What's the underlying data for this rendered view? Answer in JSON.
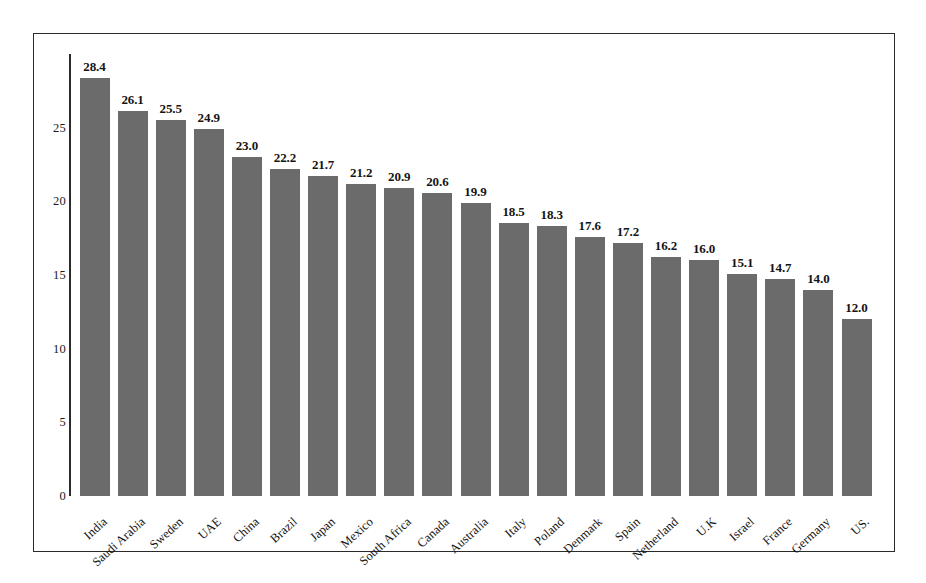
{
  "chart_data": {
    "type": "bar",
    "title": "",
    "subtitle": "",
    "xlabel": "",
    "ylabel": "",
    "ylim": [
      0,
      30
    ],
    "yticks": [
      0,
      5,
      10,
      15,
      20,
      25
    ],
    "ytick_labels": [
      "0",
      "5",
      "10",
      "15",
      "20",
      "25"
    ],
    "grid": false,
    "legend": false,
    "bar_color": "#6b6b6b",
    "frame_color": "#2b2b2b",
    "value_label_format": "one-decimal",
    "categories": [
      "India",
      "Saudi Arabia",
      "Sweden",
      "UAE",
      "China",
      "Brazil",
      "Japan",
      "Mexico",
      "South Africa",
      "Canada",
      "Australia",
      "Italy",
      "Poland",
      "Denmark",
      "Spain",
      "Netherland",
      "U.K",
      "Israel",
      "France",
      "Germany",
      "US."
    ],
    "values": [
      28.4,
      26.1,
      25.5,
      24.9,
      23.0,
      22.2,
      21.7,
      21.2,
      20.9,
      20.6,
      19.9,
      18.5,
      18.3,
      17.6,
      17.2,
      16.2,
      16.0,
      15.1,
      14.7,
      14.0,
      12.0
    ],
    "value_labels": [
      "28.4",
      "26.1",
      "25.5",
      "24.9",
      "23.0",
      "22.2",
      "21.7",
      "21.2",
      "20.9",
      "20.6",
      "19.9",
      "18.5",
      "18.3",
      "17.6",
      "17.2",
      "16.2",
      "16.0",
      "15.1",
      "14.7",
      "14.0",
      "12.0"
    ]
  }
}
